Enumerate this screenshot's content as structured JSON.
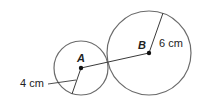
{
  "diagram": {
    "colors": {
      "stroke": "#6b6b6b",
      "ink": "#1a1a1a",
      "background": "#ffffff"
    },
    "circles": [
      {
        "id": "A",
        "label": "A",
        "cx": 81,
        "cy": 68,
        "r": 27,
        "radius_label": "4 cm"
      },
      {
        "id": "B",
        "label": "B",
        "cx": 149,
        "cy": 53,
        "r": 42,
        "radius_label": "6 cm"
      }
    ],
    "segment_AB": {
      "from": "A",
      "to": "B"
    }
  }
}
